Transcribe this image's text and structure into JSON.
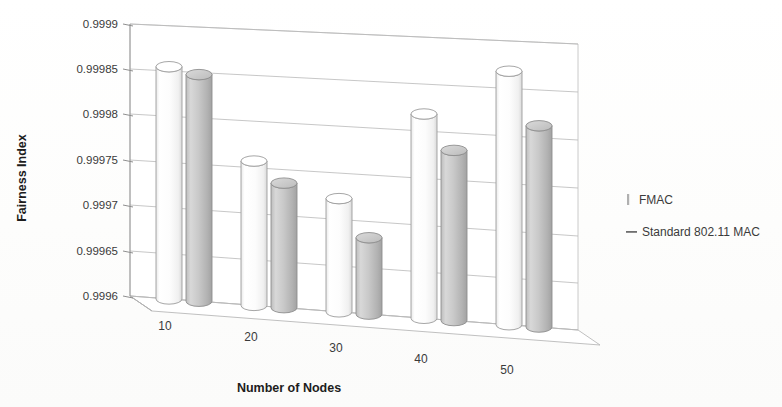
{
  "chart_data": {
    "type": "bar",
    "title": "",
    "xlabel": "Number of Nodes",
    "ylabel": "Fairness Index",
    "categories": [
      "10",
      "20",
      "30",
      "40",
      "50"
    ],
    "ylim": [
      0.9996,
      0.9999
    ],
    "yticks": [
      "0.9996",
      "0.99965",
      "0.9997",
      "0.99975",
      "0.9998",
      "0.99985",
      "0.9999"
    ],
    "ytick_values": [
      0.9996,
      0.99965,
      0.9997,
      0.99975,
      0.9998,
      0.99985,
      0.9999
    ],
    "grid": true,
    "legend_position": "right",
    "three_d": true,
    "series": [
      {
        "name": "FMAC",
        "marker": "vertical-bar",
        "color": "#fdfdfd",
        "edge_color": "#9c9c9c",
        "values": [
          0.999855,
          0.999757,
          0.999722,
          0.999818,
          0.999868
        ]
      },
      {
        "name": "Standard 802.11 MAC",
        "marker": "horizontal-dash",
        "color": "#c9c9c9",
        "edge_color": "#8e8e8e",
        "values": [
          0.999848,
          0.999735,
          0.999682,
          0.999781,
          0.999812
        ]
      }
    ]
  },
  "legend": {
    "items": [
      {
        "label": "FMAC",
        "marker": "vertical-bar-marker"
      },
      {
        "label": "Standard 802.11 MAC",
        "marker": "horizontal-dash-marker"
      }
    ]
  },
  "axes": {
    "y_title": "Fairness Index",
    "x_title": "Number of Nodes",
    "y_ticks": [
      "0.9999",
      "0.99985",
      "0.9998",
      "0.99975",
      "0.9997",
      "0.99965",
      "0.9996"
    ],
    "x_ticks": [
      "10",
      "20",
      "30",
      "40",
      "50"
    ]
  }
}
